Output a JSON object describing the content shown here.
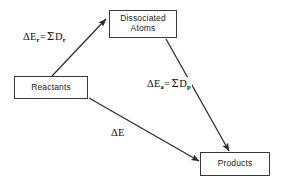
{
  "figure": {
    "background_color": "#ffffff",
    "stroke_color": "#3a3a3a",
    "text_color": "#222222"
  },
  "nodes": [
    {
      "id": "dissociated-atoms",
      "line1": "Dissociated",
      "line2": "Atoms",
      "x": 109,
      "y": 10,
      "width": 68,
      "height": 28
    },
    {
      "id": "reactants",
      "line1": "Reactants",
      "line2": "",
      "x": 14,
      "y": 76,
      "width": 74,
      "height": 23
    },
    {
      "id": "products",
      "line1": "Products",
      "line2": "",
      "x": 200,
      "y": 152,
      "width": 70,
      "height": 24
    }
  ],
  "labels": {
    "reactants_dissociation": {
      "delta": "Δ",
      "e": "E",
      "subscript_left": "r",
      "equals": "=",
      "sigma": "Σ",
      "d": "D",
      "subscript_right": "r",
      "plain": "ΔEᵣ = ΣDᵣ"
    },
    "products_formation": {
      "delta": "Δ",
      "e": "E",
      "subscript_left": "a",
      "equals": "=",
      "sigma": "Σ",
      "d": "D",
      "subscript_right": "p",
      "plain": "ΔEₐ = ΣDₚ"
    },
    "overall": {
      "delta": "Δ",
      "e": "E",
      "plain": "ΔE"
    }
  },
  "arrows": [
    {
      "id": "reactants-to-dissociated-atoms",
      "from": "reactants",
      "to": "dissociated-atoms",
      "x1": 52,
      "y1": 76,
      "x2": 106,
      "y2": 19,
      "label": "reactants_dissociation"
    },
    {
      "id": "dissociated-atoms-to-products",
      "from": "dissociated-atoms",
      "to": "products",
      "x1": 166,
      "y1": 39,
      "x2": 229,
      "y2": 151,
      "label": "products_formation"
    },
    {
      "id": "reactants-to-products",
      "from": "reactants",
      "to": "products",
      "x1": 89,
      "y1": 98,
      "x2": 199,
      "y2": 161,
      "label": "overall"
    }
  ]
}
